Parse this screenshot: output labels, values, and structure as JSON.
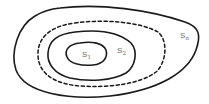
{
  "diagram": {
    "type": "nested-sets",
    "stroke_color": "#1a1a1a",
    "label_color": "#6a6a6a",
    "regions": [
      {
        "id": "s1",
        "label": "S",
        "subscript": "1",
        "style": "solid"
      },
      {
        "id": "s2",
        "label": "S",
        "subscript": "2",
        "style": "solid"
      },
      {
        "id": "intermediate",
        "label": "",
        "subscript": "",
        "style": "dashed"
      },
      {
        "id": "sn",
        "label": "S",
        "subscript": "n",
        "style": "solid"
      }
    ]
  }
}
